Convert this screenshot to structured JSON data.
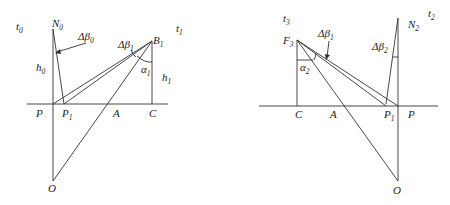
{
  "figure": {
    "left_panel": {
      "labels": {
        "t0": {
          "base": "t",
          "sub": "0"
        },
        "N0": {
          "base": "N",
          "sub": "0"
        },
        "dbeta0": {
          "base": "Δβ",
          "sub": "0"
        },
        "h0": {
          "base": "h",
          "sub": "0"
        },
        "dbeta1": {
          "base": "Δβ",
          "sub": "1"
        },
        "B1": {
          "base": "B",
          "sub": "1"
        },
        "t1": {
          "base": "t",
          "sub": "1"
        },
        "alpha1": {
          "base": "α",
          "sub": "1"
        },
        "h1": {
          "base": "h",
          "sub": "1"
        },
        "P": {
          "base": "P",
          "sub": ""
        },
        "P1": {
          "base": "P",
          "sub": "1"
        },
        "A": {
          "base": "A",
          "sub": ""
        },
        "C": {
          "base": "C",
          "sub": ""
        },
        "O": {
          "base": "O",
          "sub": ""
        }
      }
    },
    "right_panel": {
      "labels": {
        "t3": {
          "base": "t",
          "sub": "3"
        },
        "F3": {
          "base": "F",
          "sub": "3"
        },
        "dbeta1": {
          "base": "Δβ",
          "sub": "1"
        },
        "alpha2": {
          "base": "α",
          "sub": "2"
        },
        "N2": {
          "base": "N",
          "sub": "2"
        },
        "t2": {
          "base": "t",
          "sub": "2"
        },
        "dbeta2": {
          "base": "Δβ",
          "sub": "2"
        },
        "C": {
          "base": "C",
          "sub": ""
        },
        "A": {
          "base": "A",
          "sub": ""
        },
        "P1": {
          "base": "P",
          "sub": "1"
        },
        "P": {
          "base": "P",
          "sub": ""
        },
        "O": {
          "base": "O",
          "sub": ""
        }
      }
    }
  }
}
